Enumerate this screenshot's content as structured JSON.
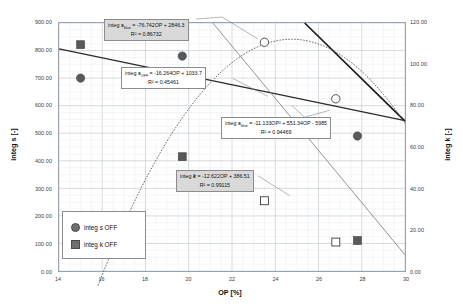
{
  "chart_data": {
    "type": "scatter",
    "title": "",
    "xlabel": "OP [%]",
    "ylabel": "integ s [-]",
    "y2label": "integ k [-]",
    "xlim": [
      14,
      30
    ],
    "ylim": [
      0,
      900
    ],
    "y2lim": [
      0,
      120
    ],
    "xticks": [
      "14",
      "16",
      "18",
      "20",
      "22",
      "24",
      "26",
      "28",
      "30"
    ],
    "yticks": [
      "0.00",
      "100.00",
      "200.00",
      "300.00",
      "400.00",
      "500.00",
      "600.00",
      "700.00",
      "800.00",
      "900.00"
    ],
    "y2ticks": [
      "0.00",
      "20.00",
      "40.00",
      "60.00",
      "80.00",
      "100.00",
      "120.00"
    ],
    "grid": true,
    "legend_position": "inside-lower-left",
    "series": [
      {
        "name": "integ s OFF",
        "marker": "filled-circle",
        "axis": "left",
        "color": "#595959",
        "points": [
          {
            "x": 15.0,
            "y": 700
          },
          {
            "x": 19.7,
            "y": 780
          },
          {
            "x": 27.8,
            "y": 490
          }
        ]
      },
      {
        "name": "integ k OFF",
        "marker": "filled-square",
        "axis": "right",
        "color": "#595959",
        "points": [
          {
            "x": 15.0,
            "y": 109.5
          },
          {
            "x": 19.7,
            "y": 55.3
          },
          {
            "x": 27.8,
            "y": 14.7
          }
        ]
      },
      {
        "name": "integ s blue",
        "marker": "open-circle",
        "axis": "left",
        "color": "#333333",
        "points": [
          {
            "x": 23.5,
            "y": 830
          },
          {
            "x": 26.8,
            "y": 625
          }
        ]
      },
      {
        "name": "integ k blue",
        "marker": "open-square",
        "axis": "right",
        "color": "#333333",
        "points": [
          {
            "x": 23.5,
            "y": 34.0
          },
          {
            "x": 26.8,
            "y": 14.0
          }
        ]
      }
    ],
    "trendlines": [
      {
        "name": "integ s blue linear",
        "style": "solid-thick",
        "color": "#1a1a1a",
        "equation": "integ s_blue = -76.742OP + 2846.3",
        "r2": "R² = 0.86732",
        "slope": -76.742,
        "intercept": 2846.3,
        "axis": "left"
      },
      {
        "name": "integ s OFF linear",
        "style": "solid-medium",
        "color": "#2b2b2b",
        "equation": "integ s_OFF = -16.264OP + 1033.7",
        "r2": "R² = 0.45461",
        "slope": -16.264,
        "intercept": 1033.7,
        "axis": "left"
      },
      {
        "name": "integ s blue polynomial",
        "style": "dotted",
        "color": "#555555",
        "equation": "integ s_blue = -11.133OP² + 551.34OP - 5985",
        "r2": "R² = 0.94469",
        "a": -11.133,
        "b": 551.34,
        "c": -5985,
        "axis": "left"
      },
      {
        "name": "integ k linear",
        "style": "solid-thin-gray",
        "color": "#808080",
        "equation": "integ k = -12.622OP + 386.51",
        "r2": "R² = 0.99115",
        "slope": -12.622,
        "intercept": 386.51,
        "axis": "right"
      }
    ],
    "annotations": [
      {
        "id": "eq1",
        "line1_pre": "integ ",
        "line1_var": "s",
        "line1_sub": "blue",
        "line1_post": " = -76.742OP + 2846.3",
        "line2": "R² = 0.86732"
      },
      {
        "id": "eq2",
        "line1_pre": "integ ",
        "line1_var": "s",
        "line1_sub": "OFF",
        "line1_post": " = -16.264OP + 1033.7",
        "line2": "R² = 0.45461"
      },
      {
        "id": "eq3",
        "line1_pre": "integ ",
        "line1_var": "s",
        "line1_sub": "blue",
        "line1_post": " = -11.133OP² + 551.34OP - 5985",
        "line2": "R² = 0.94469"
      },
      {
        "id": "eq4",
        "line1_pre": "integ ",
        "line1_var": "k",
        "line1_sub": "",
        "line1_post": " = -12.622OP + 386.51",
        "line2": "R² = 0.99115"
      }
    ],
    "legend_entries": [
      {
        "label": "integ s OFF",
        "marker": "circle"
      },
      {
        "label": "integ k OFF",
        "marker": "square"
      }
    ]
  }
}
